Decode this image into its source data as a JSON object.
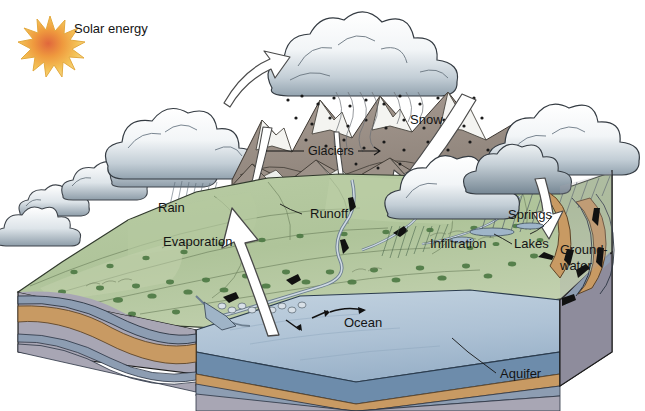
{
  "diagram": {
    "labels": {
      "solar_energy": "Solar energy",
      "rain": "Rain",
      "evaporation": "Evaporation",
      "glaciers": "Glaciers",
      "snow": "Snow",
      "runoff": "Runoff",
      "springs": "Springs",
      "infiltration": "Infiltration",
      "lakes": "Lakes",
      "groundwater_line1": "Ground-",
      "groundwater_line2": "water",
      "ocean": "Ocean",
      "aquifer": "Aquifer"
    },
    "colors": {
      "sun_core": "#e8743a",
      "sun_mid": "#f2a33c",
      "sun_edge": "#f5c95e",
      "cloud_light": "#ffffff",
      "cloud_shade": "#aebcc6",
      "cloud_dark": "#7d8d99",
      "cloud_outline": "#3a4048",
      "grass_light": "#c6d3b0",
      "grass_mid": "#a9bd93",
      "grass_dark": "#8fa87c",
      "tree_green": "#4e7a45",
      "mountain_rock": "#9a8f86",
      "mountain_snow": "#f2f2f0",
      "ocean_top": "#b3c7d9",
      "ocean_deep": "#6d8cab",
      "rock_gray": "#a8a6b4",
      "rock_blue": "#8d9db2",
      "aquifer_tan": "#c89a63",
      "side_face": "#8e8c9c",
      "outline": "#1d1d1d",
      "label_text": "#141414"
    },
    "legend_items": [
      {
        "name": "solar-energy",
        "text": "Solar energy"
      },
      {
        "name": "rain",
        "text": "Rain"
      },
      {
        "name": "evaporation",
        "text": "Evaporation"
      },
      {
        "name": "glaciers",
        "text": "Glaciers"
      },
      {
        "name": "snow",
        "text": "Snow"
      },
      {
        "name": "runoff",
        "text": "Runoff"
      },
      {
        "name": "springs",
        "text": "Springs"
      },
      {
        "name": "infiltration",
        "text": "Infiltration"
      },
      {
        "name": "lakes",
        "text": "Lakes"
      },
      {
        "name": "groundwater",
        "text": "Ground-water"
      },
      {
        "name": "ocean",
        "text": "Ocean"
      },
      {
        "name": "aquifer",
        "text": "Aquifer"
      }
    ]
  }
}
